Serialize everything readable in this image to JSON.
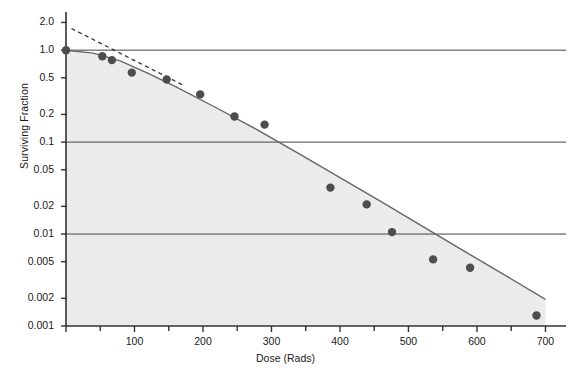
{
  "chart_data": {
    "type": "scatter",
    "title": "",
    "xlabel": "Dose (Rads)",
    "ylabel": "Surviving Fraction",
    "xlim": [
      0,
      730
    ],
    "ylim": [
      0.001,
      2.6
    ],
    "yscale": "log",
    "grid": "horizontal gridlines at 1.0, 0.1, 0.01",
    "legend": "none",
    "xticks": [
      0,
      100,
      200,
      300,
      400,
      500,
      600,
      700
    ],
    "xtick_labels": [
      "",
      "100",
      "200",
      "300",
      "400",
      "500",
      "600",
      "700"
    ],
    "xminorticks": [
      50,
      150,
      250,
      350,
      450,
      550,
      650
    ],
    "yticks": [
      2.0,
      1.0,
      0.5,
      0.2,
      0.1,
      0.05,
      0.02,
      0.01,
      0.005,
      0.002,
      0.001
    ],
    "ytick_labels": [
      "2.0",
      "1.0",
      "0.5",
      "0.2",
      "0.1",
      "0.05",
      "0.02",
      "0.01",
      "0.005",
      "0.002",
      "0.001"
    ],
    "gridlines_y": [
      1.0,
      0.1,
      0.01
    ],
    "series": [
      {
        "name": "Survival data points",
        "type": "scatter",
        "marker": "filled-circle",
        "color": "#4d4d4d",
        "points": [
          {
            "x": 0,
            "y": 1.0
          },
          {
            "x": 53,
            "y": 0.86
          },
          {
            "x": 67,
            "y": 0.78
          },
          {
            "x": 96,
            "y": 0.57
          },
          {
            "x": 147,
            "y": 0.48
          },
          {
            "x": 196,
            "y": 0.33
          },
          {
            "x": 246,
            "y": 0.19
          },
          {
            "x": 290,
            "y": 0.155
          },
          {
            "x": 386,
            "y": 0.032
          },
          {
            "x": 439,
            "y": 0.021
          },
          {
            "x": 476,
            "y": 0.0105
          },
          {
            "x": 536,
            "y": 0.0053
          },
          {
            "x": 590,
            "y": 0.0043
          },
          {
            "x": 687,
            "y": 0.0013
          }
        ]
      },
      {
        "name": "Survival curve fit",
        "type": "line",
        "style": "solid",
        "color": "#666666",
        "points": [
          {
            "x": 0,
            "y": 1.0
          },
          {
            "x": 40,
            "y": 0.93
          },
          {
            "x": 80,
            "y": 0.76
          },
          {
            "x": 120,
            "y": 0.56
          },
          {
            "x": 160,
            "y": 0.4
          },
          {
            "x": 220,
            "y": 0.235
          },
          {
            "x": 280,
            "y": 0.135
          },
          {
            "x": 340,
            "y": 0.075
          },
          {
            "x": 400,
            "y": 0.041
          },
          {
            "x": 460,
            "y": 0.0225
          },
          {
            "x": 520,
            "y": 0.0122
          },
          {
            "x": 580,
            "y": 0.0066
          },
          {
            "x": 640,
            "y": 0.0036
          },
          {
            "x": 700,
            "y": 0.00195
          }
        ]
      },
      {
        "name": "Extrapolated initial slope",
        "type": "line",
        "style": "dashed",
        "color": "#333333",
        "points": [
          {
            "x": 8,
            "y": 1.72
          },
          {
            "x": 170,
            "y": 0.42
          }
        ]
      }
    ]
  },
  "axes": {
    "x_axis_label": "Dose (Rads)",
    "y_axis_label": "Surviving Fraction"
  },
  "style": {
    "plot_fill": "#ebebeb",
    "axis_color": "#333333",
    "marker_color": "#4d4d4d",
    "curve_color": "#666666",
    "dashed_color": "#333333",
    "gridline_color": "#444444",
    "background": "#ffffff"
  }
}
